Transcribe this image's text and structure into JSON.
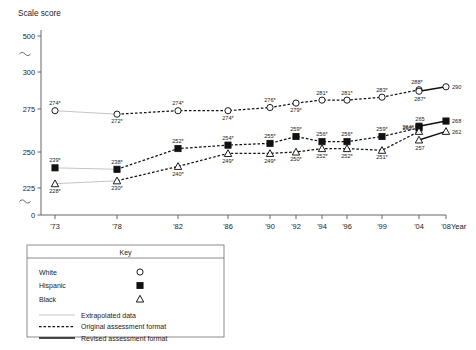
{
  "chart_data": {
    "type": "line",
    "title": "",
    "ylabel": "Scale score",
    "xlabel": "Year",
    "grid": false,
    "ylim": [
      0,
      500
    ],
    "y_ticks": [
      "0",
      "225",
      "250",
      "275",
      "300",
      "500"
    ],
    "y_breaks": [
      "between 0 and 225",
      "between 300 and 500"
    ],
    "x_ticks": [
      "'73",
      "'78",
      "'82",
      "'86",
      "'90",
      "'92",
      "'94",
      "'96",
      "'99",
      "'04",
      "'08"
    ],
    "categories": [
      "'73",
      "'78",
      "'82",
      "'86",
      "'90",
      "'92",
      "'94",
      "'96",
      "'99",
      "'04",
      "'08"
    ],
    "legend_position": "below-left",
    "series": [
      {
        "name": "White",
        "marker": "open-circle",
        "values": [
          274,
          272,
          274,
          274,
          276,
          279,
          281,
          281,
          283,
          288,
          null
        ],
        "labels": [
          "274*",
          "272*",
          "274*",
          "274*",
          "276*",
          "279*",
          "281*",
          "281*",
          "283*",
          "288*",
          ""
        ],
        "revised_values": [
          null,
          null,
          null,
          null,
          null,
          null,
          null,
          null,
          null,
          287,
          290
        ],
        "revised_labels": [
          "",
          "",
          "",
          "",
          "",
          "",
          "",
          "",
          "",
          "287*",
          "290"
        ]
      },
      {
        "name": "Hispanic",
        "marker": "filled-square",
        "values": [
          239,
          238,
          252,
          254,
          255,
          259,
          256,
          256,
          259,
          264,
          null
        ],
        "labels": [
          "239*",
          "238*",
          "252*",
          "254*",
          "255*",
          "259*",
          "256*",
          "256*",
          "259*",
          "264*",
          ""
        ],
        "revised_values": [
          null,
          null,
          null,
          null,
          null,
          null,
          null,
          null,
          null,
          265,
          268
        ],
        "revised_labels": [
          "",
          "",
          "",
          "",
          "",
          "",
          "",
          "",
          "",
          "265",
          "268"
        ]
      },
      {
        "name": "Black",
        "marker": "open-triangle",
        "values": [
          228,
          230,
          240,
          249,
          249,
          250,
          252,
          252,
          251,
          262,
          null
        ],
        "labels": [
          "228*",
          "230*",
          "240*",
          "249*",
          "249*",
          "250*",
          "252*",
          "252*",
          "251*",
          "262*",
          ""
        ],
        "revised_values": [
          null,
          null,
          null,
          null,
          null,
          null,
          null,
          null,
          null,
          257,
          262
        ],
        "revised_labels": [
          "",
          "",
          "",
          "",
          "",
          "",
          "",
          "",
          "",
          "257",
          "262"
        ]
      }
    ],
    "line_style_notes": {
      "extrapolated_segment": "'73 to '78",
      "original_format_segment": "'78 to '04",
      "revised_format_segment": "'04 to '08"
    }
  },
  "legend": {
    "title": "Key",
    "entries": [
      {
        "label": "White",
        "marker": "open-circle"
      },
      {
        "label": "Hispanic",
        "marker": "filled-square"
      },
      {
        "label": "Black",
        "marker": "open-triangle"
      }
    ],
    "line_entries": [
      {
        "label": "Extrapolated data",
        "style": "thin-grey-solid"
      },
      {
        "label": "Original assessment format",
        "style": "black-dashed"
      },
      {
        "label": "Revised assessment format",
        "style": "black-solid"
      }
    ]
  }
}
